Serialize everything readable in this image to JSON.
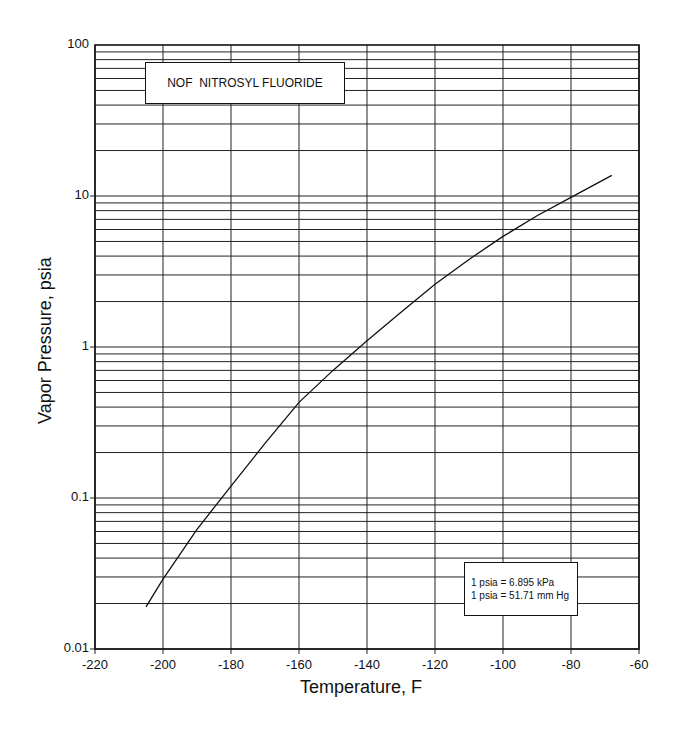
{
  "chart_data": {
    "type": "line",
    "title": "NOF  NITROSYL FLUORIDE",
    "xlabel": "Temperature, F",
    "ylabel": "Vapor Pressure, psia",
    "xlim": [
      -220,
      -60
    ],
    "ylim": [
      0.01,
      100
    ],
    "yscale": "log",
    "grid": true,
    "x_ticks": [
      "-220",
      "-200",
      "-180",
      "-160",
      "-140",
      "-120",
      "-100",
      "-80",
      "-60"
    ],
    "y_ticks": [
      "0.01",
      "0.1",
      "1",
      "10",
      "100"
    ],
    "series": [
      {
        "name": "NOF vapor pressure",
        "x": [
          -205,
          -200,
          -190,
          -180,
          -170,
          -160,
          -150,
          -140,
          -130,
          -120,
          -110,
          -100,
          -90,
          -80,
          -68
        ],
        "y": [
          0.019,
          0.029,
          0.062,
          0.12,
          0.23,
          0.43,
          0.7,
          1.1,
          1.7,
          2.6,
          3.8,
          5.4,
          7.4,
          9.8,
          13.7
        ]
      }
    ],
    "annotations": [
      "1 psia = 6.895 kPa",
      "1 psia = 51.71 mm Hg"
    ]
  },
  "title_box": {
    "text": "NOF  NITROSYL FLUORIDE"
  },
  "conversion_box": {
    "line1": "1 psia = 6.895 kPa",
    "line2": "1 psia = 51.71 mm Hg"
  },
  "axes": {
    "xlabel": "Temperature, F",
    "ylabel": "Vapor Pressure, psia",
    "x_ticks": [
      "-220",
      "-200",
      "-180",
      "-160",
      "-140",
      "-120",
      "-100",
      "-80",
      "-60"
    ],
    "y_ticks": [
      "100",
      "10",
      "1",
      "0.1",
      "0.01"
    ]
  }
}
